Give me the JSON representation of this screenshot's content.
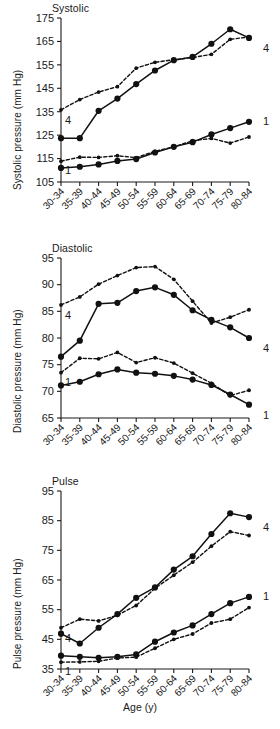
{
  "figure": {
    "xlabel": "Age (y)",
    "panels": [
      "Systolic",
      "Diastolic",
      "Pulse"
    ]
  },
  "chart_data": [
    {
      "type": "line",
      "title": "Systolic",
      "xlabel": "Age (y)",
      "ylabel": "Systolic pressure (mm Hg)",
      "categories": [
        "30-34",
        "35-39",
        "40-44",
        "45-49",
        "50-54",
        "55-59",
        "60-64",
        "65-69",
        "70-74",
        "75-79",
        "80-84"
      ],
      "ylim": [
        105,
        175
      ],
      "yticks": [
        105,
        115,
        125,
        135,
        145,
        155,
        165,
        175
      ],
      "grid": false,
      "legend_position": "right-inline",
      "series": [
        {
          "name": "4",
          "style": "solid",
          "marker": "large-filled-circle",
          "values": [
            123.7,
            123.7,
            135.4,
            140.6,
            146.8,
            152.6,
            157.0,
            158.4,
            164.0,
            170.2,
            166.5
          ]
        },
        {
          "name": "4",
          "style": "dashed",
          "marker": "small-filled-circle",
          "values": [
            135.8,
            140.2,
            143.4,
            145.7,
            153.6,
            156.1,
            157.2,
            158.1,
            159.5,
            165.9,
            166.9
          ]
        },
        {
          "name": "1",
          "style": "solid",
          "marker": "large-filled-circle",
          "values": [
            111.0,
            111.5,
            112.5,
            114.0,
            114.8,
            117.6,
            120.0,
            122.0,
            125.3,
            128.0,
            130.7
          ]
        },
        {
          "name": "1",
          "style": "dashed",
          "marker": "small-filled-circle",
          "values": [
            113.9,
            115.6,
            115.5,
            116.2,
            115.4,
            118.1,
            120.0,
            122.6,
            123.6,
            121.6,
            124.2
          ]
        }
      ]
    },
    {
      "type": "line",
      "title": "Diastolic",
      "xlabel": "Age (y)",
      "ylabel": "Diastolic pressure (mm Hg)",
      "categories": [
        "30-34",
        "35-39",
        "40-44",
        "45-49",
        "50-54",
        "55-59",
        "60-64",
        "65-69",
        "70-74",
        "75-79",
        "80-84"
      ],
      "ylim": [
        65,
        95
      ],
      "yticks": [
        65,
        70,
        75,
        80,
        85,
        90,
        95
      ],
      "grid": false,
      "legend_position": "right-inline",
      "series": [
        {
          "name": "4",
          "style": "solid",
          "marker": "large-filled-circle",
          "values": [
            76.5,
            79.5,
            86.4,
            86.6,
            88.8,
            89.5,
            88.1,
            85.2,
            83.4,
            82.0,
            80.0
          ]
        },
        {
          "name": "4",
          "style": "dashed",
          "marker": "small-filled-circle",
          "values": [
            86.2,
            87.7,
            90.1,
            91.7,
            93.2,
            93.4,
            91.0,
            86.9,
            82.8,
            83.9,
            85.3
          ]
        },
        {
          "name": "1",
          "style": "solid",
          "marker": "large-filled-circle",
          "values": [
            71.1,
            71.8,
            73.2,
            74.1,
            73.5,
            73.3,
            72.9,
            72.2,
            71.2,
            69.4,
            67.5
          ]
        },
        {
          "name": "1",
          "style": "dashed",
          "marker": "small-filled-circle",
          "values": [
            73.5,
            76.2,
            76.1,
            77.3,
            75.4,
            76.3,
            75.3,
            73.4,
            71.5,
            69.2,
            70.2
          ]
        }
      ]
    },
    {
      "type": "line",
      "title": "Pulse",
      "xlabel": "Age (y)",
      "ylabel": "Pulse pressure (mm Hg)",
      "categories": [
        "30-34",
        "35-39",
        "40-44",
        "45-49",
        "50-54",
        "55-59",
        "60-64",
        "65-69",
        "70-74",
        "75-79",
        "80-84"
      ],
      "ylim": [
        35,
        95
      ],
      "yticks": [
        35,
        45,
        55,
        65,
        75,
        85,
        95
      ],
      "grid": false,
      "legend_position": "right-inline",
      "series": [
        {
          "name": "4",
          "style": "solid",
          "marker": "large-filled-circle",
          "values": [
            46.9,
            43.6,
            48.9,
            53.5,
            59.0,
            62.5,
            68.5,
            73.0,
            80.5,
            87.5,
            86.2
          ]
        },
        {
          "name": "4",
          "style": "dashed",
          "marker": "small-filled-circle",
          "values": [
            48.9,
            51.8,
            51.2,
            53.1,
            56.4,
            62.2,
            66.6,
            71.0,
            76.4,
            81.3,
            80.0
          ]
        },
        {
          "name": "1",
          "style": "solid",
          "marker": "large-filled-circle",
          "values": [
            39.5,
            39.1,
            38.8,
            39.1,
            39.9,
            44.2,
            47.3,
            49.7,
            53.5,
            57.2,
            59.3
          ]
        },
        {
          "name": "1",
          "style": "dashed",
          "marker": "small-filled-circle",
          "values": [
            37.3,
            37.4,
            37.6,
            38.7,
            39.0,
            42.0,
            45.0,
            46.8,
            50.5,
            51.8,
            55.7
          ]
        }
      ]
    }
  ]
}
